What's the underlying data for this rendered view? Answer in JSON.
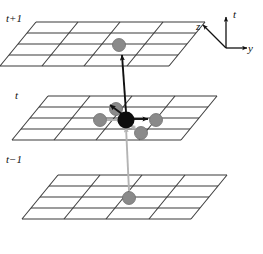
{
  "planes": [
    {
      "id": "t-plus-1",
      "label": "t+1",
      "rows": 4,
      "cols": 4
    },
    {
      "id": "t",
      "label": "t",
      "rows": 4,
      "cols": 4
    },
    {
      "id": "t-minus-1",
      "label": "t−1",
      "rows": 4,
      "cols": 4
    }
  ],
  "axes": {
    "t": "t",
    "y": "y",
    "z": "z"
  },
  "nodes": {
    "center": {
      "name": "center-cell",
      "color": "#0d0d0d",
      "radius": 8.5
    },
    "neighbor": {
      "name": "neighbor-cell",
      "color": "#8a8a8a",
      "radius": 6.5
    }
  },
  "colors": {
    "grid_line": "#3a3a3a",
    "node_center": "#0d0d0d",
    "node_neighbor": "#8a8a8a",
    "arrow_out": "#111111",
    "arrow_in": "#b4b4b4",
    "background": "#ffffff",
    "text": "#111111"
  },
  "arrows": [
    {
      "name": "arrow-up-to-next-time",
      "kind": "out",
      "color": "#111111"
    },
    {
      "name": "arrow-out-z-positive",
      "kind": "out",
      "color": "#111111"
    },
    {
      "name": "arrow-out-y-positive",
      "kind": "out",
      "color": "#111111"
    },
    {
      "name": "arrow-in-y-negative",
      "kind": "in",
      "color": "#b4b4b4"
    },
    {
      "name": "arrow-in-z-negative",
      "kind": "in",
      "color": "#b4b4b4"
    },
    {
      "name": "arrow-in-from-prev-time",
      "kind": "in",
      "color": "#b4b4b4"
    }
  ]
}
